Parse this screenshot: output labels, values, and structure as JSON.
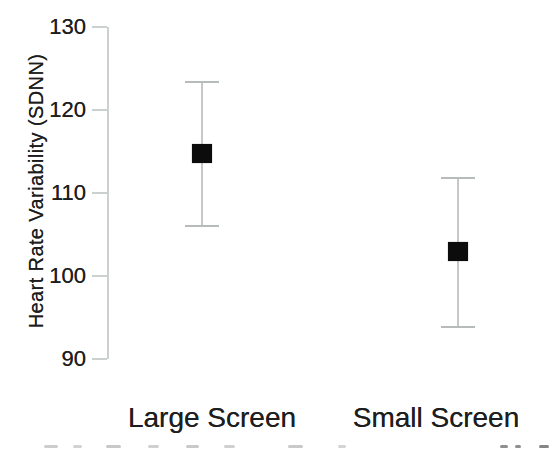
{
  "figure": {
    "background_color": "#ffffff",
    "text_color": "#1e1e1e",
    "axis_line_color": "#ccd0cf",
    "error_bar_color": "#c4c9c8",
    "error_cap_color": "#b7bcbb",
    "marker_color": "#0c0c0c"
  },
  "chart_data": {
    "type": "scatter",
    "subtype": "means-with-error-bars",
    "title": "",
    "xlabel": "",
    "ylabel": "Heart Rate Variability (SDNN)",
    "categories": [
      "Large Screen",
      "Small Screen"
    ],
    "series": [
      {
        "name": "Mean Heart Rate Variability (SDNN)",
        "values": [
          114.7,
          102.9
        ],
        "error_upper": [
          123.4,
          111.8
        ],
        "error_lower": [
          106.0,
          93.9
        ]
      }
    ],
    "ylim": [
      90,
      130
    ],
    "yticks": [
      90,
      100,
      110,
      120,
      130
    ],
    "grid": false,
    "legend": false,
    "marker_style": "filled-black-square",
    "error_bar_style": "thin-gray-vertical-line-with-caps"
  }
}
